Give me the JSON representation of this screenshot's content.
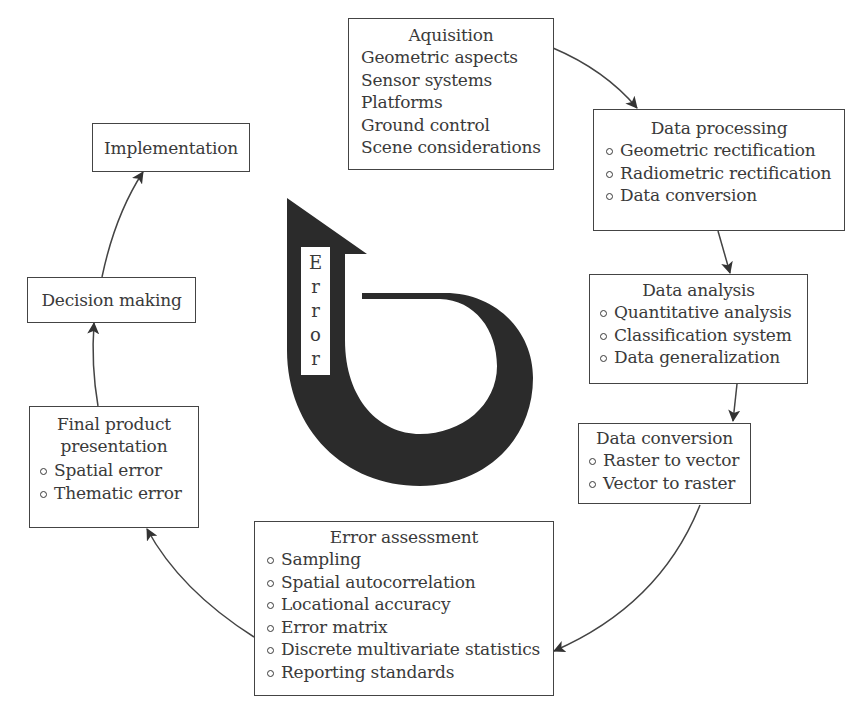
{
  "diagram": {
    "type": "cycle",
    "center_symbol": {
      "label": "Error",
      "letters": [
        "E",
        "r",
        "r",
        "o",
        "r"
      ],
      "color": "#2b2b2b"
    },
    "nodes": [
      {
        "id": "acquisition",
        "title": "Aquisition",
        "items": [
          "Geometric aspects",
          "Sensor systems",
          "Platforms",
          "Ground control",
          "Scene considerations"
        ]
      },
      {
        "id": "data-processing",
        "title": "Data processing",
        "items": [
          "Geometric rectification",
          "Radiometric rectification",
          "Data conversion"
        ]
      },
      {
        "id": "data-analysis",
        "title": "Data analysis",
        "items": [
          "Quantitative analysis",
          "Classification system",
          "Data generalization"
        ]
      },
      {
        "id": "data-conversion",
        "title": "Data conversion",
        "items": [
          "Raster to vector",
          "Vector to raster"
        ]
      },
      {
        "id": "error-assessment",
        "title": "Error assessment",
        "items": [
          "Sampling",
          "Spatial autocorrelation",
          "Locational accuracy",
          "Error matrix",
          "Discrete multivariate statistics",
          "Reporting standards"
        ]
      },
      {
        "id": "final-product-presentation",
        "title_lines": [
          "Final product",
          "presentation"
        ],
        "items": [
          "Spatial error",
          "Thematic error"
        ]
      },
      {
        "id": "decision-making",
        "title": "Decision making"
      },
      {
        "id": "implementation",
        "title": "Implementation"
      }
    ],
    "edges": [
      [
        "acquisition",
        "data-processing"
      ],
      [
        "data-processing",
        "data-analysis"
      ],
      [
        "data-analysis",
        "data-conversion"
      ],
      [
        "data-conversion",
        "error-assessment"
      ],
      [
        "error-assessment",
        "final-product-presentation"
      ],
      [
        "final-product-presentation",
        "decision-making"
      ],
      [
        "decision-making",
        "implementation"
      ]
    ]
  }
}
